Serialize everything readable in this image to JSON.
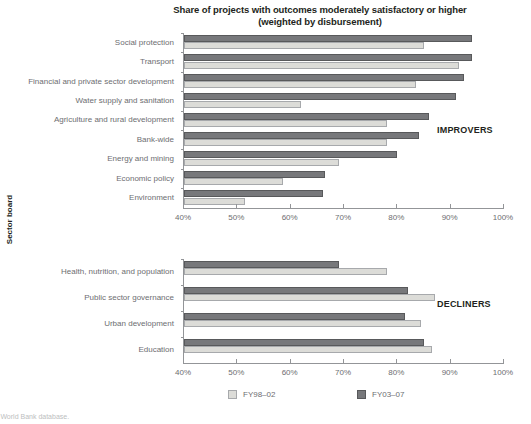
{
  "chart_data": {
    "type": "bar",
    "orientation": "horizontal",
    "title": "Share of projects with outcomes moderately satisfactory or higher (weighted by disbursement)",
    "title_lines": [
      "Share of projects with outcomes moderately satisfactory or higher",
      "(weighted by disbursement)"
    ],
    "xlabel": "",
    "ylabel": "Sector board",
    "xlim": [
      40,
      100
    ],
    "xticks": [
      40,
      50,
      60,
      70,
      80,
      90,
      100
    ],
    "xtick_labels": [
      "40%",
      "50%",
      "60%",
      "70%",
      "80%",
      "90%",
      "100%"
    ],
    "grid": false,
    "legend": {
      "position": "bottom",
      "entries": [
        {
          "name": "FY98–02",
          "color": "#dcdcd8"
        },
        {
          "name": "FY03–07",
          "color": "#77787b"
        }
      ]
    },
    "panels": [
      {
        "annotation": "IMPROVERS",
        "categories": [
          "Social protection",
          "Transport",
          "Financial and private sector development",
          "Water supply and sanitation",
          "Agriculture and rural development",
          "Bank-wide",
          "Energy and mining",
          "Economic policy",
          "Environment"
        ],
        "series": [
          {
            "name": "FY98–02",
            "values": [
              85.0,
              91.5,
              83.5,
              62.0,
              78.0,
              78.0,
              69.0,
              58.5,
              51.5
            ]
          },
          {
            "name": "FY03–07",
            "values": [
              94.0,
              94.0,
              92.5,
              91.0,
              86.0,
              84.0,
              80.0,
              66.5,
              66.0
            ]
          }
        ]
      },
      {
        "annotation": "DECLINERS",
        "categories": [
          "Health, nutrition, and population",
          "Public sector governance",
          "Urban development",
          "Education"
        ],
        "series": [
          {
            "name": "FY98–02",
            "values": [
              78.0,
              87.0,
              84.5,
              86.5
            ]
          },
          {
            "name": "FY03–07",
            "values": [
              69.0,
              82.0,
              81.5,
              85.0
            ]
          }
        ]
      }
    ]
  },
  "source_note": "s: World Bank database."
}
